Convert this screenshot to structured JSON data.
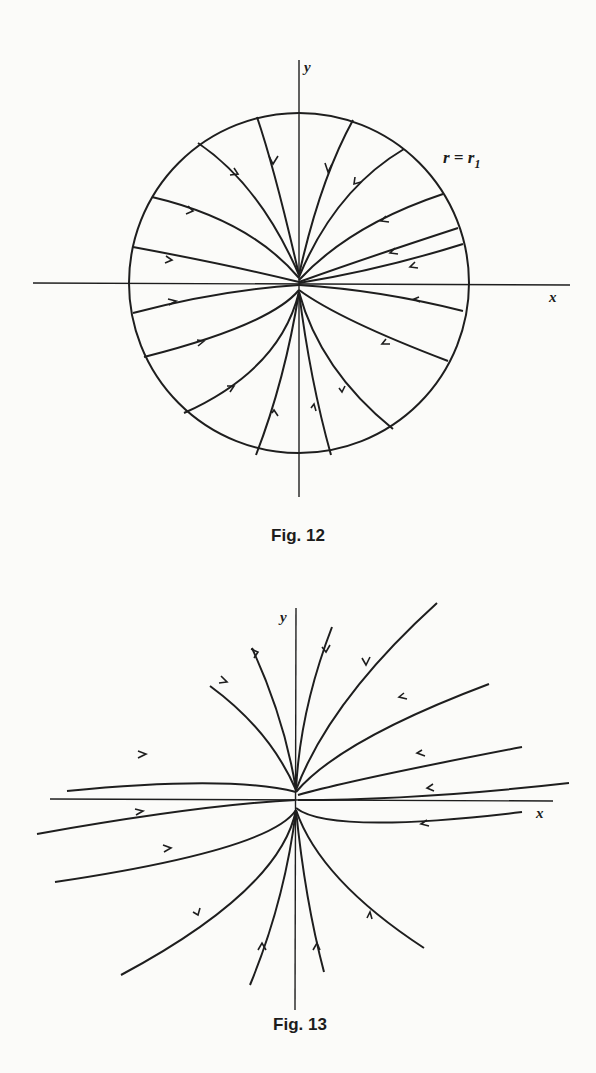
{
  "figures": [
    {
      "id": "fig12",
      "caption": "Fig. 12",
      "x_label": "x",
      "y_label": "y",
      "circle_label_r": "r = r",
      "circle_label_sub": "1",
      "description": "Phase portrait of a stable node: trajectories inside the circle r = r1 flow inward to the origin, tangent to the y-axis"
    },
    {
      "id": "fig13",
      "caption": "Fig. 13",
      "x_label": "x",
      "y_label": "y",
      "description": "Phase portrait of a stable node: trajectories approach the origin tangent to the y-axis from all directions"
    }
  ],
  "colors": {
    "ink": "#1e1e1e",
    "paper": "#fbfbf9"
  }
}
